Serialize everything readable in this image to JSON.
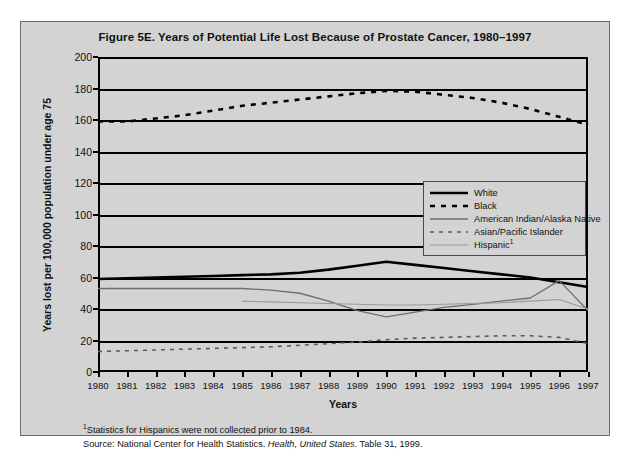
{
  "figure": {
    "title": "Figure 5E. Years of Potential Life Lost Because of Prostate Cancer, 1980–1997",
    "panel_color": "#d3d3d3",
    "border_color": "#6b6b6b"
  },
  "footnotes": {
    "marker": "1",
    "note": "Statistics for Hispanics were not collected prior to 1984.",
    "source_prefix": "Source: National Center for Health Statistics. ",
    "source_italic": "Health, United States.",
    "source_suffix": " Table 31, 1999."
  },
  "legend": {
    "position": "inside-right-middle",
    "entries": [
      {
        "label": "White",
        "style": "solid",
        "width": 2.6,
        "color": "#000000",
        "icon": "legend-line-solid-black"
      },
      {
        "label": "Black",
        "style": "dashed",
        "width": 2.6,
        "color": "#000000",
        "icon": "legend-line-dashed-black"
      },
      {
        "label": "American Indian/Alaska Native",
        "style": "solid",
        "width": 1.3,
        "color": "#6e6e6e",
        "icon": "legend-line-solid-gray"
      },
      {
        "label": "Asian/Pacific Islander",
        "style": "dashed",
        "width": 1.6,
        "color": "#5a5a5a",
        "icon": "legend-line-dashed-gray"
      },
      {
        "label": "Hispanic",
        "label_sup": "1",
        "style": "solid",
        "width": 1.1,
        "color": "#9a9a9a",
        "icon": "legend-line-solid-lightgray"
      }
    ]
  },
  "chart_data": {
    "type": "line",
    "title": "Figure 5E. Years of Potential Life Lost Because of Prostate Cancer, 1980–1997",
    "xlabel": "Years",
    "ylabel": "Years lost per 100,000 population under age 75",
    "xlim": [
      1980,
      1997
    ],
    "ylim": [
      0,
      200
    ],
    "yticks": [
      0,
      20,
      40,
      60,
      80,
      100,
      120,
      140,
      160,
      180,
      200
    ],
    "grid": "horizontal",
    "legend_position": "inside-right-middle",
    "x": [
      1980,
      1981,
      1982,
      1983,
      1984,
      1985,
      1986,
      1987,
      1988,
      1989,
      1990,
      1991,
      1992,
      1993,
      1994,
      1995,
      1996,
      1997
    ],
    "series": [
      {
        "name": "White",
        "style": "solid",
        "color": "#000000",
        "width": 2.6,
        "values": [
          59,
          59.5,
          60,
          60.5,
          61,
          61.5,
          62,
          63,
          65,
          67.5,
          70,
          68,
          66,
          64,
          62,
          60,
          57,
          54
        ]
      },
      {
        "name": "Black",
        "style": "dashed",
        "color": "#000000",
        "width": 2.6,
        "values": [
          159,
          159,
          161,
          163,
          166,
          169,
          171,
          173,
          175,
          177,
          178.5,
          178,
          176,
          174,
          171,
          167,
          162,
          157
        ]
      },
      {
        "name": "American Indian/Alaska Native",
        "style": "solid",
        "color": "#6e6e6e",
        "width": 1.3,
        "values": [
          53,
          53,
          53,
          53,
          53,
          53,
          52,
          50,
          45,
          39,
          35,
          38,
          41,
          43,
          45,
          47,
          58,
          39
        ]
      },
      {
        "name": "Asian/Pacific Islander",
        "style": "dashed",
        "color": "#5a5a5a",
        "width": 1.6,
        "values": [
          13,
          13.5,
          14,
          14.5,
          15,
          15.5,
          16,
          17,
          18,
          19,
          20.5,
          21.5,
          22,
          22.5,
          23,
          23,
          22,
          18
        ]
      },
      {
        "name": "Hispanic",
        "style": "solid",
        "color": "#9a9a9a",
        "width": 1.1,
        "note_marker": "1",
        "values": [
          null,
          null,
          null,
          null,
          null,
          45,
          44.5,
          44,
          43.5,
          43,
          42.5,
          42.5,
          43,
          43.5,
          44,
          45,
          46,
          40
        ]
      }
    ]
  }
}
